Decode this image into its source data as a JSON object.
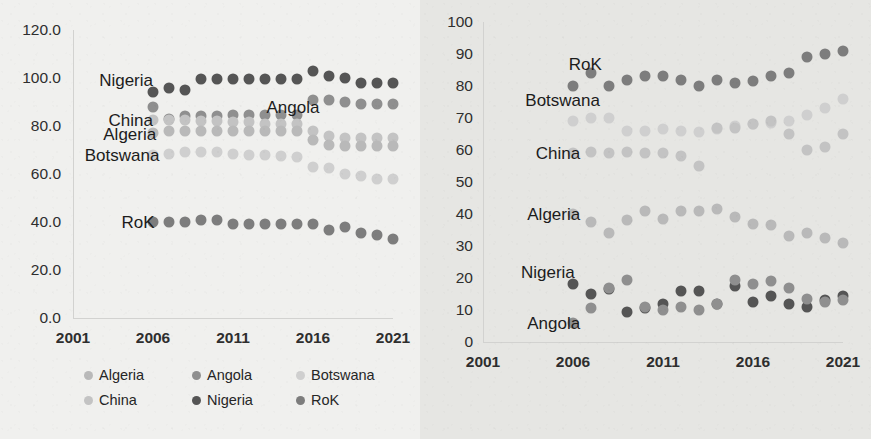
{
  "colors": {
    "algeria": "#b9b9b9",
    "angola": "#8f8f8f",
    "botswana": "#cfcfcf",
    "china": "#c3c3c3",
    "nigeria": "#555555",
    "rok": "#7d7d7d",
    "axis": "#d2d2d0",
    "text": "#2e2e2e"
  },
  "legend": {
    "items": [
      {
        "label": "Algeria",
        "color": "#b9b9b9"
      },
      {
        "label": "Angola",
        "color": "#8f8f8f"
      },
      {
        "label": "Botswana",
        "color": "#cfcfcf"
      },
      {
        "label": "China",
        "color": "#c3c3c3"
      },
      {
        "label": "Nigeria",
        "color": "#555555"
      },
      {
        "label": "RoK",
        "color": "#7d7d7d"
      }
    ]
  },
  "chart_data": [
    {
      "id": "left",
      "type": "scatter",
      "title": "",
      "xlabel": "",
      "ylabel": "",
      "xlim": [
        2001,
        2021
      ],
      "ylim": [
        0,
        120
      ],
      "xticks": [
        "2001",
        "2006",
        "2011",
        "2016",
        "2021"
      ],
      "xtickvalues": [
        2001,
        2006,
        2011,
        2016,
        2021
      ],
      "yticks": [
        "0.0",
        "20.0",
        "40.0",
        "60.0",
        "80.0",
        "100.0",
        "120.0"
      ],
      "ytickvalues": [
        0,
        20,
        40,
        60,
        80,
        100,
        120
      ],
      "grid": false,
      "legend_position": "bottom",
      "annotations": [
        {
          "text": "Nigeria",
          "x": 2006.0,
          "y": 99.0
        },
        {
          "text": "Angola",
          "x": 2016.4,
          "y": 88.0
        },
        {
          "text": "China",
          "x": 2006.0,
          "y": 82.5
        },
        {
          "text": "Algeria",
          "x": 2006.2,
          "y": 76.5
        },
        {
          "text": "Botswana",
          "x": 2006.4,
          "y": 68.0
        },
        {
          "text": "RoK",
          "x": 2006.1,
          "y": 40.0
        }
      ],
      "x": [
        2006,
        2007,
        2008,
        2009,
        2010,
        2011,
        2012,
        2013,
        2014,
        2015,
        2016,
        2017,
        2018,
        2019,
        2020,
        2021
      ],
      "series": [
        {
          "name": "Nigeria",
          "color": "#555555",
          "values": [
            94.0,
            96.0,
            95.0,
            99.5,
            99.5,
            99.5,
            99.5,
            99.5,
            99.5,
            99.5,
            103.0,
            101.0,
            100.0,
            98.0,
            98.0,
            98.0
          ]
        },
        {
          "name": "Angola",
          "color": "#8f8f8f",
          "values": [
            88.0,
            83.0,
            84.0,
            84.0,
            84.0,
            84.5,
            84.5,
            84.5,
            84.5,
            84.5,
            91.0,
            91.0,
            90.0,
            89.0,
            89.0,
            89.0
          ]
        },
        {
          "name": "China",
          "color": "#c3c3c3",
          "values": [
            82.5,
            82.5,
            82.5,
            82.0,
            82.0,
            81.5,
            81.5,
            81.0,
            81.0,
            81.0,
            78.0,
            76.0,
            75.0,
            75.0,
            75.0,
            75.0
          ]
        },
        {
          "name": "Algeria",
          "color": "#b9b9b9",
          "values": [
            77.0,
            78.0,
            78.0,
            78.0,
            78.0,
            78.0,
            78.0,
            78.0,
            78.0,
            78.0,
            74.0,
            72.0,
            71.5,
            71.5,
            71.5,
            71.5
          ]
        },
        {
          "name": "Botswana",
          "color": "#cfcfcf",
          "values": [
            68.0,
            68.5,
            69.0,
            69.0,
            69.0,
            68.5,
            68.0,
            68.0,
            67.5,
            67.0,
            63.0,
            62.5,
            60.0,
            59.0,
            58.0,
            58.0
          ]
        },
        {
          "name": "RoK",
          "color": "#7d7d7d",
          "values": [
            40.0,
            40.0,
            40.0,
            41.0,
            41.0,
            39.0,
            39.0,
            39.0,
            39.0,
            39.0,
            39.0,
            36.5,
            38.0,
            35.5,
            34.5,
            33.0
          ]
        }
      ]
    },
    {
      "id": "right",
      "type": "scatter",
      "title": "",
      "xlabel": "",
      "ylabel": "",
      "xlim": [
        2001,
        2021
      ],
      "ylim": [
        0,
        100
      ],
      "xticks": [
        "2001",
        "2006",
        "2011",
        "2016",
        "2021"
      ],
      "xtickvalues": [
        2001,
        2006,
        2011,
        2016,
        2021
      ],
      "yticks": [
        "0",
        "10",
        "20",
        "30",
        "40",
        "50",
        "60",
        "70",
        "80",
        "90",
        "100"
      ],
      "ytickvalues": [
        0,
        10,
        20,
        30,
        40,
        50,
        60,
        70,
        80,
        90,
        100
      ],
      "grid": false,
      "legend_position": "none",
      "annotations": [
        {
          "text": "RoK",
          "x": 2007.6,
          "y": 87.0
        },
        {
          "text": "Botswana",
          "x": 2007.5,
          "y": 75.5
        },
        {
          "text": "China",
          "x": 2006.4,
          "y": 59.0
        },
        {
          "text": "Algeria",
          "x": 2006.4,
          "y": 40.0
        },
        {
          "text": "Nigeria",
          "x": 2006.1,
          "y": 22.0
        },
        {
          "text": "Angola",
          "x": 2006.4,
          "y": 6.0
        }
      ],
      "x": [
        2006,
        2007,
        2008,
        2009,
        2010,
        2011,
        2012,
        2013,
        2014,
        2015,
        2016,
        2017,
        2018,
        2019,
        2020,
        2021
      ],
      "series": [
        {
          "name": "RoK",
          "color": "#7d7d7d",
          "values": [
            80.0,
            84.0,
            80.0,
            82.0,
            83.0,
            83.0,
            82.0,
            80.0,
            82.0,
            81.0,
            81.5,
            83.0,
            84.0,
            89.0,
            90.0,
            91.0
          ]
        },
        {
          "name": "Botswana",
          "color": "#cfcfcf",
          "values": [
            69.0,
            70.0,
            70.0,
            66.0,
            66.0,
            66.5,
            66.0,
            65.5,
            66.5,
            67.5,
            68.0,
            68.5,
            69.0,
            71.0,
            73.0,
            76.0
          ]
        },
        {
          "name": "China",
          "color": "#c3c3c3",
          "values": [
            59.0,
            59.5,
            59.0,
            59.5,
            59.0,
            59.0,
            58.0,
            55.0,
            67.0,
            67.0,
            68.0,
            69.0,
            65.0,
            60.0,
            61.0,
            65.0
          ]
        },
        {
          "name": "Algeria",
          "color": "#b9b9b9",
          "values": [
            40.0,
            37.5,
            34.0,
            38.0,
            41.0,
            38.5,
            41.0,
            41.0,
            41.5,
            39.0,
            37.0,
            36.5,
            33.0,
            34.0,
            32.5,
            31.0
          ]
        },
        {
          "name": "Nigeria",
          "color": "#555555",
          "values": [
            18.0,
            15.0,
            16.5,
            9.5,
            10.5,
            12.0,
            16.0,
            16.0,
            12.0,
            17.5,
            12.5,
            14.5,
            12.0,
            11.0,
            13.0,
            14.5
          ]
        },
        {
          "name": "Angola",
          "color": "#8f8f8f",
          "values": [
            6.0,
            10.5,
            17.0,
            19.5,
            11.0,
            10.0,
            11.0,
            10.0,
            12.0,
            19.5,
            18.0,
            19.0,
            17.0,
            13.5,
            12.5,
            13.0
          ]
        }
      ]
    }
  ]
}
